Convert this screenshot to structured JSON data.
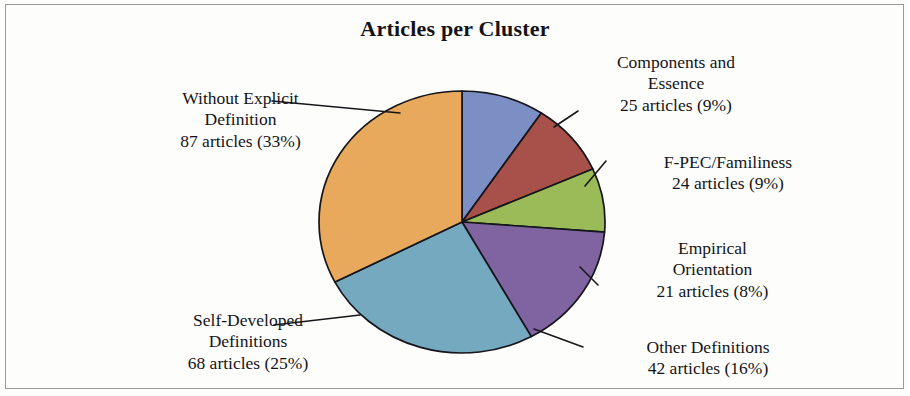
{
  "chart_data": {
    "type": "pie",
    "title": "Articles per Cluster",
    "xlabel": "",
    "ylabel": "",
    "legend": "none",
    "grid": false,
    "total_articles": 267,
    "value_unit": "articles",
    "categories": [
      "Components and Essence",
      "F-PEC/Familiness",
      "Empirical Orientation",
      "Other Definitions",
      "Self-Developed Definitions",
      "Without Explicit Definition"
    ],
    "values": [
      25,
      24,
      21,
      42,
      68,
      87
    ],
    "percentages": [
      9,
      9,
      8,
      16,
      25,
      33
    ],
    "colors": [
      "#7B8FC4",
      "#A8504A",
      "#9BBB59",
      "#8064A2",
      "#74A9C0",
      "#E8A95C"
    ],
    "slices": [
      {
        "name": "Components and Essence",
        "name_line1": "Components and",
        "name_line2": "Essence",
        "value": 25,
        "percent": 9,
        "value_label": "25 articles (9%)",
        "color": "#7B8FC4",
        "start_angle_deg": 0,
        "end_angle_deg": 33.7
      },
      {
        "name": "F-PEC/Familiness",
        "name_line1": "F-PEC/Familiness",
        "name_line2": "",
        "value": 24,
        "percent": 9,
        "value_label": "24 articles (9%)",
        "color": "#A8504A",
        "start_angle_deg": 33.7,
        "end_angle_deg": 66.1
      },
      {
        "name": "Empirical Orientation",
        "name_line1": "Empirical",
        "name_line2": "Orientation",
        "value": 21,
        "percent": 8,
        "value_label": "21 articles (8%)",
        "color": "#9BBB59",
        "start_angle_deg": 66.1,
        "end_angle_deg": 94.4
      },
      {
        "name": "Other Definitions",
        "name_line1": "Other Definitions",
        "name_line2": "",
        "value": 42,
        "percent": 16,
        "value_label": "42 articles (16%)",
        "color": "#8064A2",
        "start_angle_deg": 94.4,
        "end_angle_deg": 151.0
      },
      {
        "name": "Self-Developed Definitions",
        "name_line1": "Self-Developed",
        "name_line2": "Definitions",
        "value": 68,
        "percent": 25,
        "value_label": "68 articles (25%)",
        "color": "#74A9C0",
        "start_angle_deg": 151.0,
        "end_angle_deg": 242.7
      },
      {
        "name": "Without Explicit Definition",
        "name_line1": "Without Explicit",
        "name_line2": "Definition",
        "value": 87,
        "percent": 33,
        "value_label": "87 articles (33%)",
        "color": "#E8A95C",
        "start_angle_deg": 242.7,
        "end_angle_deg": 360
      }
    ]
  },
  "chart": {
    "title": "Articles per Cluster"
  },
  "labels": {
    "components": {
      "line1": "Components and",
      "line2": "Essence",
      "value": "25 articles (9%)"
    },
    "fpec": {
      "line1": "F-PEC/Familiness",
      "value": "24 articles (9%)"
    },
    "empirical": {
      "line1": "Empirical",
      "line2": "Orientation",
      "value": "21 articles (8%)"
    },
    "other": {
      "line1": "Other Definitions",
      "value": "42 articles (16%)"
    },
    "self_developed": {
      "line1": "Self-Developed",
      "line2": "Definitions",
      "value": "68 articles (25%)"
    },
    "without_explicit": {
      "line1": "Without Explicit",
      "line2": "Definition",
      "value": "87 articles (33%)"
    }
  }
}
